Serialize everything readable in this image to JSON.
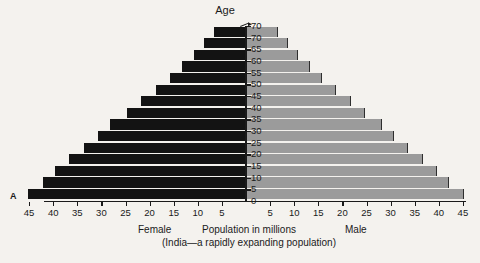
{
  "panel": {
    "letter": "A"
  },
  "axis": {
    "age_title": "Age",
    "age_ticks": [
      "70",
      "70",
      "65",
      "60",
      "55",
      "50",
      "45",
      "40",
      "35",
      "30",
      "25",
      "20",
      "15",
      "10",
      "5",
      "0"
    ],
    "female_ticks": [
      "45",
      "40",
      "35",
      "30",
      "25",
      "20",
      "15",
      "10",
      "5"
    ],
    "male_ticks": [
      "5",
      "10",
      "15",
      "20",
      "25",
      "30",
      "35",
      "40",
      "45"
    ]
  },
  "captions": {
    "female": "Female",
    "male": "Male",
    "main": "Population in millions",
    "sub": "(India—a rapidly expanding population)"
  },
  "colors": {
    "female_bar": "#131313",
    "male_bar": "#9b9b9b",
    "axis": "#1a1a1a",
    "background": "#f4f2ee"
  },
  "chart_data": {
    "type": "bar",
    "title": "Population in millions",
    "subtitle": "(India—a rapidly expanding population)",
    "xlabel": "Population in millions",
    "ylabel": "Age",
    "orientation": "population-pyramid",
    "categories": [
      "over 70",
      "65-70",
      "60-65",
      "55-60",
      "50-55",
      "45-50",
      "40-45",
      "35-40",
      "30-35",
      "25-30",
      "20-25",
      "15-20",
      "10-15",
      "5-10",
      "0-5"
    ],
    "xlim": [
      0,
      47
    ],
    "ylim": [
      0,
      70
    ],
    "grid": false,
    "legend": "none",
    "series": [
      {
        "name": "Female",
        "side": "left",
        "color": "#131313",
        "values": [
          6.5,
          8.5,
          10.5,
          13.0,
          15.5,
          18.5,
          21.5,
          24.5,
          28.0,
          30.5,
          33.5,
          36.5,
          39.5,
          42.0,
          45.0
        ]
      },
      {
        "name": "Male",
        "side": "right",
        "color": "#9b9b9b",
        "values": [
          6.5,
          8.5,
          10.5,
          13.0,
          15.5,
          18.5,
          21.5,
          24.5,
          28.0,
          30.5,
          33.5,
          36.5,
          39.5,
          42.0,
          45.0
        ]
      }
    ]
  }
}
